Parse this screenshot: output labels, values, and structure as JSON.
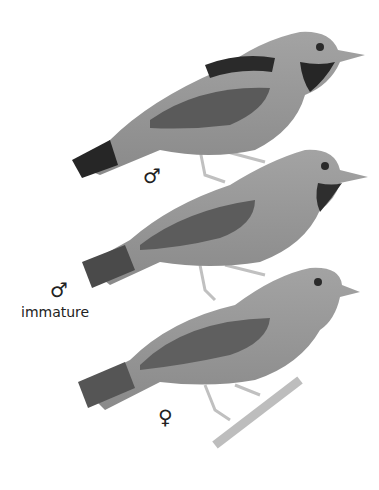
{
  "plate": {
    "description": "Field-guide illustration of three birds perched vertically",
    "colors": {
      "body": "#8f8f8f",
      "head": "#9a9a9a",
      "dark": "#2e2e2e",
      "wing": "#5a5a5a",
      "leg": "#c8c8c8",
      "branch": "#bdbdbd"
    },
    "figures": [
      {
        "id": "adult-male",
        "symbol": "♂",
        "caption": ""
      },
      {
        "id": "immature-male",
        "symbol": "♂",
        "caption": "immature"
      },
      {
        "id": "female",
        "symbol": "♀",
        "caption": ""
      }
    ]
  }
}
